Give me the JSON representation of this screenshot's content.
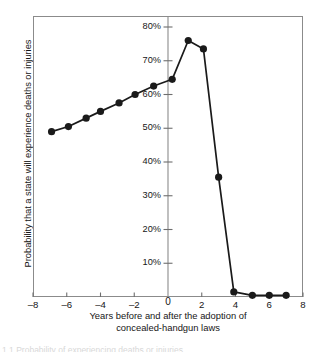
{
  "chart_data": {
    "type": "line",
    "title": "",
    "subtitle": "",
    "xlabel_lines": [
      "Years before and after the adoption of",
      "concealed-handgun laws"
    ],
    "xlabel": "Years before and after the adoption of concealed-handgun laws",
    "ylabel": "Probability that a state will experience deaths or injuries",
    "xlim": [
      -8,
      8
    ],
    "ylim": [
      0,
      85
    ],
    "xticks": [
      -8,
      -6,
      -4,
      -2,
      0,
      2,
      4,
      6,
      8
    ],
    "xticklabels": [
      "–8",
      "–6",
      "–4",
      "–2",
      "0",
      "2",
      "4",
      "6",
      "8"
    ],
    "yticks": [
      10,
      20,
      30,
      40,
      50,
      60,
      70,
      80
    ],
    "yticklabels": [
      "10%",
      "20%",
      "30%",
      "40%",
      "50%",
      "60%",
      "70%",
      "80%"
    ],
    "grid": false,
    "legend": null,
    "marker": "filled-circle",
    "series": [
      {
        "name": "Probability of deaths or injuries",
        "x": [
          -6.9,
          -5.9,
          -4.85,
          -4.0,
          -2.9,
          -1.95,
          -0.85,
          0.25,
          1.2,
          2.1,
          3.0,
          3.9,
          5.0,
          6.0,
          7.0
        ],
        "y": [
          49.0,
          50.5,
          53.0,
          55.0,
          57.5,
          60.0,
          62.5,
          64.5,
          76.0,
          73.5,
          35.5,
          1.5,
          0.5,
          0.5,
          0.5
        ]
      }
    ],
    "line_color": "#1a1a1a",
    "marker_color": "#1a1a1a",
    "axis_color": "#8b8b8b",
    "tick_color": "#6e6e6e",
    "vertical_axis_at_x": 0
  },
  "caption": {
    "cut_off_line": "1.1  Probability of experiencing deaths or injuries"
  }
}
